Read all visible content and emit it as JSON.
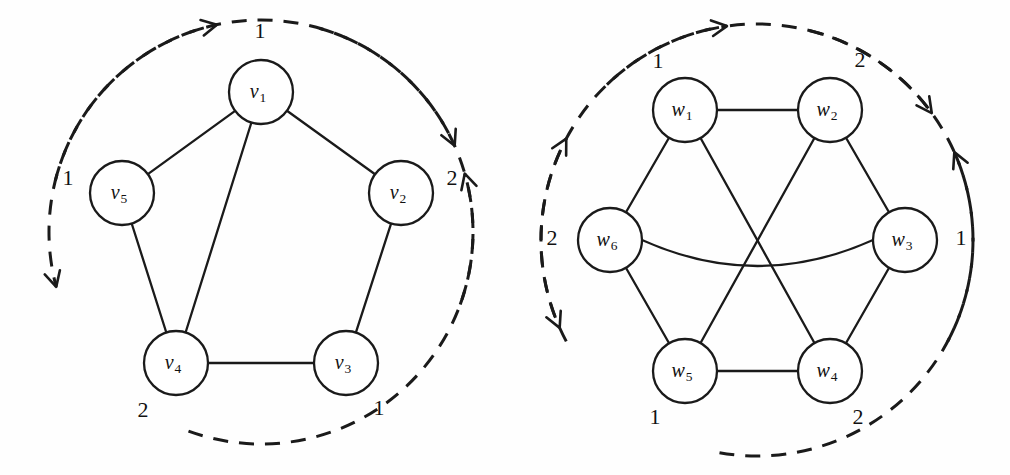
{
  "figure": {
    "background_color": "#fefefe",
    "ink_color": "#1a1a1a",
    "width": 1010,
    "height": 475
  },
  "chart_data": {
    "type": "diagram",
    "title": "",
    "subtitle": "",
    "graphs": [
      {
        "id": "left-graph",
        "name": "pentagon-graph",
        "center": [
          261,
          232
        ],
        "layout_radius": 145,
        "vertex_radius": 32,
        "vertices": [
          {
            "id": "v1",
            "label": "v",
            "subscript": "1",
            "cx": 261,
            "cy": 92
          },
          {
            "id": "v2",
            "label": "v",
            "subscript": "2",
            "cx": 401,
            "cy": 193
          },
          {
            "id": "v3",
            "label": "v",
            "subscript": "3",
            "cx": 346,
            "cy": 363
          },
          {
            "id": "v4",
            "label": "v",
            "subscript": "4",
            "cx": 176,
            "cy": 363
          },
          {
            "id": "v5",
            "label": "v",
            "subscript": "5",
            "cx": 122,
            "cy": 193
          }
        ],
        "edges": [
          {
            "from": "v1",
            "to": "v2",
            "curve": 0
          },
          {
            "from": "v2",
            "to": "v3",
            "curve": 0
          },
          {
            "from": "v3",
            "to": "v4",
            "curve": 0
          },
          {
            "from": "v4",
            "to": "v5",
            "curve": 0
          },
          {
            "from": "v5",
            "to": "v1",
            "curve": 0
          },
          {
            "from": "v1",
            "to": "v4",
            "curve": 0
          }
        ],
        "position_labels": [
          {
            "text": "1",
            "x": 260,
            "y": 33
          },
          {
            "text": "2",
            "x": 452,
            "y": 180
          },
          {
            "text": "1",
            "x": 379,
            "y": 410
          },
          {
            "text": "2",
            "x": 143,
            "y": 412
          },
          {
            "text": "1",
            "x": 68,
            "y": 180
          }
        ],
        "arrows": [
          {
            "id": "arc-top-right",
            "from_angle": -76,
            "to_angle": -12,
            "radius": 212,
            "direction": "clockwise"
          },
          {
            "id": "arc-right-bottom",
            "from_angle": 16,
            "to_angle": 66,
            "radius": 212,
            "direction": "clockwise"
          },
          {
            "id": "arc-bottom",
            "from_angle": 110,
            "to_angle": 74,
            "radius": 212,
            "direction": "counterclockwise"
          },
          {
            "id": "arc-left",
            "from_angle": 200,
            "to_angle": 255,
            "radius": 212,
            "direction": "counterclockwise"
          }
        ]
      },
      {
        "id": "right-graph",
        "name": "hexagon-graph",
        "center": [
          757,
          240
        ],
        "layout_radius": 148,
        "vertex_radius": 32,
        "vertices": [
          {
            "id": "w1",
            "label": "w",
            "subscript": "1",
            "cx": 685,
            "cy": 110
          },
          {
            "id": "w2",
            "label": "w",
            "subscript": "2",
            "cx": 830,
            "cy": 110
          },
          {
            "id": "w3",
            "label": "w",
            "subscript": "3",
            "cx": 905,
            "cy": 240
          },
          {
            "id": "w4",
            "label": "w",
            "subscript": "4",
            "cx": 830,
            "cy": 371
          },
          {
            "id": "w5",
            "label": "w",
            "subscript": "5",
            "cx": 685,
            "cy": 371
          },
          {
            "id": "w6",
            "label": "w",
            "subscript": "6",
            "cx": 610,
            "cy": 240
          }
        ],
        "edges": [
          {
            "from": "w1",
            "to": "w2",
            "curve": 0
          },
          {
            "from": "w2",
            "to": "w3",
            "curve": 0
          },
          {
            "from": "w3",
            "to": "w4",
            "curve": 0
          },
          {
            "from": "w4",
            "to": "w5",
            "curve": 0
          },
          {
            "from": "w5",
            "to": "w6",
            "curve": 0
          },
          {
            "from": "w6",
            "to": "w1",
            "curve": 0
          },
          {
            "from": "w1",
            "to": "w4",
            "curve": 0
          },
          {
            "from": "w2",
            "to": "w5",
            "curve": 0
          },
          {
            "from": "w6",
            "to": "w3",
            "curve": 26
          }
        ],
        "position_labels": [
          {
            "text": "1",
            "x": 658,
            "y": 63
          },
          {
            "text": "2",
            "x": 860,
            "y": 62
          },
          {
            "text": "1",
            "x": 961,
            "y": 240
          },
          {
            "text": "2",
            "x": 858,
            "y": 419
          },
          {
            "text": "1",
            "x": 655,
            "y": 419
          },
          {
            "text": "2",
            "x": 552,
            "y": 240
          }
        ],
        "arrows": [
          {
            "id": "arc-top",
            "from_angle": -118,
            "to_angle": -62,
            "radius": 216,
            "direction": "clockwise"
          },
          {
            "id": "arc-right",
            "from_angle": -44,
            "to_angle": -8,
            "radius": 216,
            "direction": "clockwise"
          },
          {
            "id": "arc-right-bottom",
            "from_angle": 14,
            "to_angle": 54,
            "radius": 216,
            "direction": "clockwise"
          },
          {
            "id": "arc-bottom",
            "from_angle": 118,
            "to_angle": 66,
            "radius": 216,
            "direction": "counterclockwise"
          },
          {
            "id": "arc-left",
            "from_angle": 190,
            "to_angle": 246,
            "radius": 216,
            "direction": "counterclockwise"
          }
        ]
      }
    ]
  }
}
